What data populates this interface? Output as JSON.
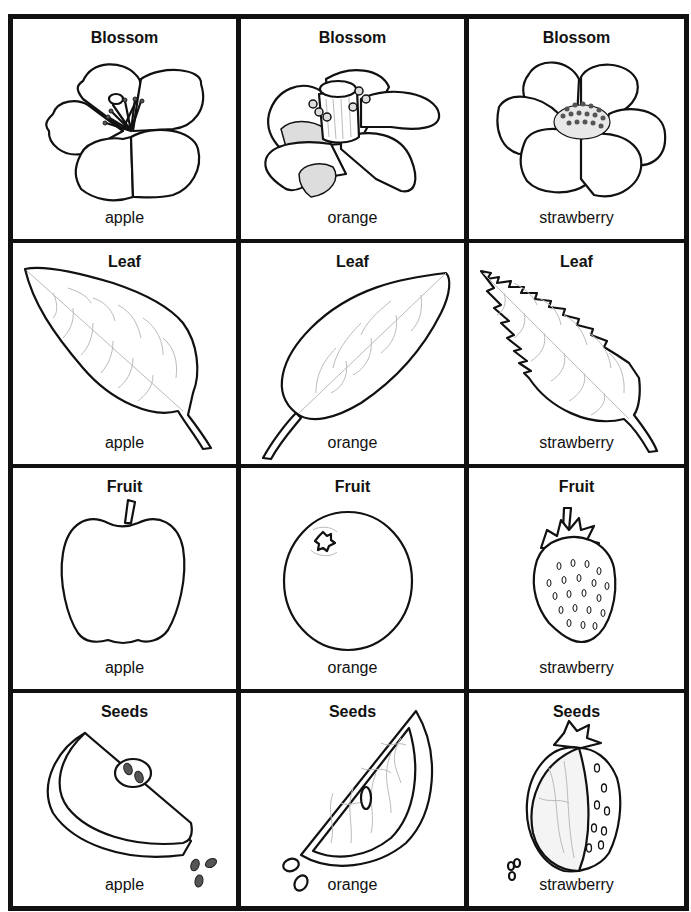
{
  "page": {
    "header_text": "... ng ... p ... p ... g ...",
    "border_color": "#111111",
    "background_color": "#ffffff"
  },
  "columns": [
    "apple",
    "orange",
    "strawberry"
  ],
  "rows": [
    {
      "title": "Blossom",
      "cells": [
        {
          "title": "Blossom",
          "label": "apple",
          "icon": "apple-blossom-icon"
        },
        {
          "title": "Blossom",
          "label": "orange",
          "icon": "orange-blossom-icon"
        },
        {
          "title": "Blossom",
          "label": "strawberry",
          "icon": "strawberry-blossom-icon"
        }
      ]
    },
    {
      "title": "Leaf",
      "cells": [
        {
          "title": "Leaf",
          "label": "apple",
          "icon": "apple-leaf-icon"
        },
        {
          "title": "Leaf",
          "label": "orange",
          "icon": "orange-leaf-icon"
        },
        {
          "title": "Leaf",
          "label": "strawberry",
          "icon": "strawberry-leaf-icon"
        }
      ]
    },
    {
      "title": "Fruit",
      "cells": [
        {
          "title": "Fruit",
          "label": "apple",
          "icon": "apple-fruit-icon"
        },
        {
          "title": "Fruit",
          "label": "orange",
          "icon": "orange-fruit-icon"
        },
        {
          "title": "Fruit",
          "label": "strawberry",
          "icon": "strawberry-fruit-icon"
        }
      ]
    },
    {
      "title": "Seeds",
      "cells": [
        {
          "title": "Seeds",
          "label": "apple",
          "icon": "apple-seeds-icon"
        },
        {
          "title": "Seeds",
          "label": "orange",
          "icon": "orange-seeds-icon"
        },
        {
          "title": "Seeds",
          "label": "strawberry",
          "icon": "strawberry-seeds-icon"
        }
      ]
    }
  ]
}
